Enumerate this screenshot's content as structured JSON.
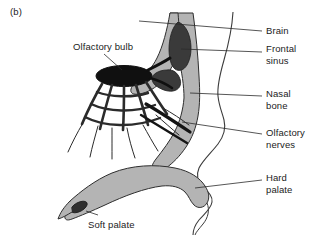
{
  "figure": {
    "panel_letter": "(b)",
    "background_color": "#ffffff",
    "line_color": "#1b1b1b",
    "tissue_fill": "#b0b0b0",
    "dark_fill": "#3a3a3a",
    "bulb_fill": "#111111"
  },
  "labels": {
    "olfactory_bulb": "Olfactory bulb",
    "brain": "Brain",
    "frontal_sinus_line1": "Frontal",
    "frontal_sinus_line2": "sinus",
    "nasal_bone_line1": "Nasal",
    "nasal_bone_line2": "bone",
    "olfactory_nerves_line1": "Olfactory",
    "olfactory_nerves_line2": "nerves",
    "hard_palate_line1": "Hard",
    "hard_palate_line2": "palate",
    "soft_palate": "Soft palate"
  }
}
